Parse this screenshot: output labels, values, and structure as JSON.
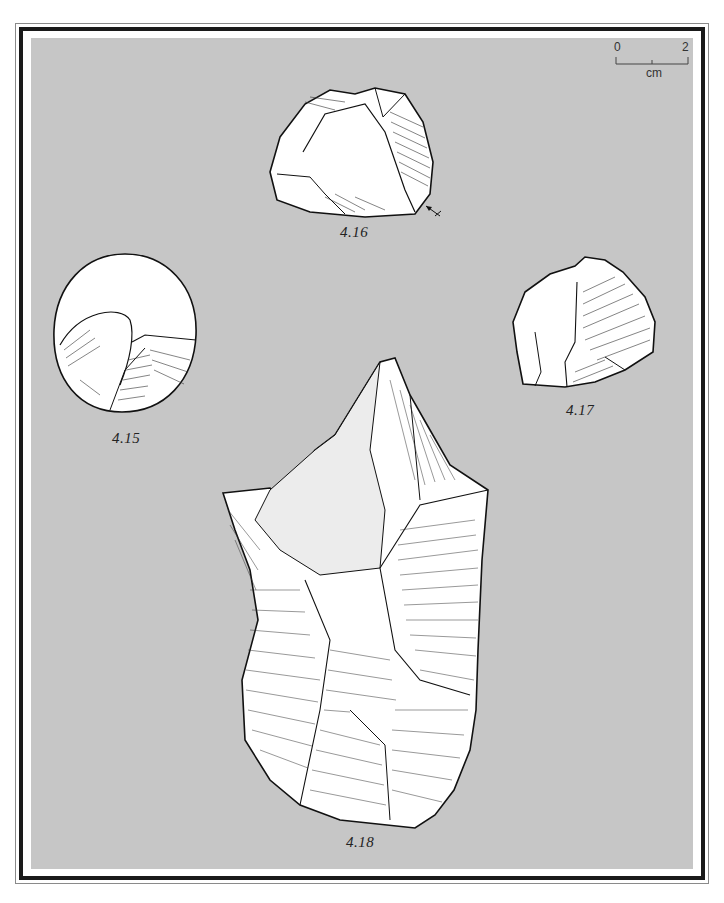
{
  "plate": {
    "background_color": "#c6c6c6",
    "frame_color": "#1a1a1a",
    "scale_bar": {
      "start_label": "0",
      "end_label": "2",
      "unit": "cm"
    },
    "figures": [
      {
        "id": "fig-4-16",
        "label": "4.16"
      },
      {
        "id": "fig-4-15",
        "label": "4.15"
      },
      {
        "id": "fig-4-17",
        "label": "4.17"
      },
      {
        "id": "fig-4-18",
        "label": "4.18"
      }
    ]
  }
}
